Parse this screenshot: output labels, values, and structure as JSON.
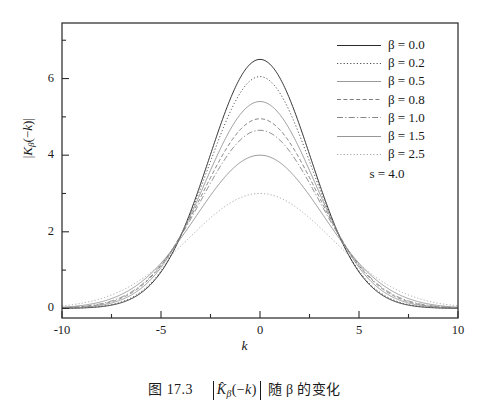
{
  "caption": {
    "figure_number": "图 17.3",
    "formula_inner": "K̂β(−k)",
    "suffix": "随 β 的变化",
    "full_text": "图 17.3  |K̂β(−k)| 随 β 的变化"
  },
  "legend": {
    "note": "s = 4.0",
    "entries": [
      {
        "label": "β = 0.0",
        "style": "solid",
        "color": "#2b2b2b"
      },
      {
        "label": "β = 0.2",
        "style": "dotted",
        "color": "#3a3a3a"
      },
      {
        "label": "β = 0.5",
        "style": "solid",
        "color": "#8e8e8e"
      },
      {
        "label": "β = 0.8",
        "style": "dashed",
        "color": "#6e6e6e"
      },
      {
        "label": "β = 1.0",
        "style": "dashdot",
        "color": "#7a7a7a"
      },
      {
        "label": "β = 1.5",
        "style": "solid",
        "color": "#8a8a8a"
      },
      {
        "label": "β = 2.5",
        "style": "dotted",
        "color": "#9a9a9a"
      }
    ]
  },
  "axes": {
    "x_title": "k",
    "y_title": "|Kβ(−k)|",
    "x_ticks": [
      "-10",
      "-5",
      "0",
      "5",
      "10"
    ],
    "y_ticks": [
      "0",
      "2",
      "4",
      "6"
    ]
  },
  "chart_data": {
    "type": "line",
    "title": "",
    "xlabel": "k",
    "ylabel": "|K_beta(-k)|",
    "xlim": [
      -10,
      10
    ],
    "ylim": [
      -0.25,
      7.45
    ],
    "xticks": [
      -10,
      -5,
      0,
      5,
      10
    ],
    "yticks": [
      0,
      2,
      4,
      6
    ],
    "xminor": [
      -7.5,
      -2.5,
      2.5,
      7.5
    ],
    "yminor": [
      1,
      3,
      5,
      7
    ],
    "grid": false,
    "legend_position": "upper right",
    "annotations": [
      "s = 4.0"
    ],
    "x": [
      -10,
      -9.5,
      -9,
      -8.5,
      -8,
      -7.5,
      -7,
      -6.5,
      -6,
      -5.5,
      -5,
      -4.5,
      -4,
      -3.5,
      -3,
      -2.5,
      -2,
      -1.5,
      -1,
      -0.5,
      0,
      0.5,
      1,
      1.5,
      2,
      2.5,
      3,
      3.5,
      4,
      4.5,
      5,
      5.5,
      6,
      6.5,
      7,
      7.5,
      8,
      8.5,
      9,
      9.5,
      10
    ],
    "series": [
      {
        "name": "β = 0.0",
        "peak": 6.5,
        "width": 2.55,
        "style": "solid",
        "color": "#2b2b2b",
        "values": [
          0.01,
          0.02,
          0.03,
          0.05,
          0.08,
          0.13,
          0.2,
          0.31,
          0.46,
          0.68,
          0.97,
          1.34,
          1.81,
          2.37,
          3.0,
          3.68,
          4.37,
          5.03,
          5.6,
          6.08,
          6.5,
          6.08,
          5.6,
          5.03,
          4.37,
          3.68,
          3.0,
          2.37,
          1.81,
          1.34,
          0.97,
          0.68,
          0.46,
          0.31,
          0.2,
          0.13,
          0.08,
          0.05,
          0.03,
          0.02,
          0.01
        ]
      },
      {
        "name": "β = 0.2",
        "peak": 6.05,
        "width": 2.62,
        "style": "dotted",
        "color": "#3a3a3a",
        "values": [
          0.01,
          0.02,
          0.03,
          0.05,
          0.09,
          0.14,
          0.22,
          0.33,
          0.48,
          0.69,
          0.97,
          1.32,
          1.75,
          2.26,
          2.84,
          3.45,
          4.07,
          4.67,
          5.2,
          5.68,
          6.05,
          5.68,
          5.2,
          4.67,
          4.07,
          3.45,
          2.84,
          2.26,
          1.75,
          1.32,
          0.97,
          0.69,
          0.48,
          0.33,
          0.22,
          0.14,
          0.09,
          0.05,
          0.03,
          0.02,
          0.01
        ]
      },
      {
        "name": "β = 0.5",
        "peak": 5.4,
        "width": 2.78,
        "style": "solid",
        "color": "#8e8e8e",
        "values": [
          0.01,
          0.02,
          0.04,
          0.06,
          0.1,
          0.16,
          0.24,
          0.35,
          0.51,
          0.71,
          0.97,
          1.3,
          1.69,
          2.15,
          2.66,
          3.2,
          3.74,
          4.27,
          4.74,
          5.14,
          5.4,
          5.14,
          4.74,
          4.27,
          3.74,
          3.2,
          2.66,
          2.15,
          1.69,
          1.3,
          0.97,
          0.71,
          0.51,
          0.35,
          0.24,
          0.16,
          0.1,
          0.06,
          0.04,
          0.02,
          0.01
        ]
      },
      {
        "name": "β = 0.8",
        "peak": 4.95,
        "width": 2.9,
        "style": "dashed",
        "color": "#6e6e6e",
        "values": [
          0.02,
          0.03,
          0.05,
          0.07,
          0.11,
          0.17,
          0.26,
          0.38,
          0.53,
          0.73,
          0.98,
          1.28,
          1.64,
          2.05,
          2.5,
          2.97,
          3.45,
          3.9,
          4.31,
          4.68,
          4.95,
          4.68,
          4.31,
          3.9,
          3.45,
          2.97,
          2.5,
          2.05,
          1.64,
          1.28,
          0.98,
          0.73,
          0.53,
          0.38,
          0.26,
          0.17,
          0.11,
          0.07,
          0.05,
          0.03,
          0.02
        ]
      },
      {
        "name": "β = 1.0",
        "peak": 4.65,
        "width": 2.98,
        "style": "dashdot",
        "color": "#7a7a7a",
        "values": [
          0.02,
          0.03,
          0.05,
          0.08,
          0.12,
          0.18,
          0.27,
          0.39,
          0.55,
          0.75,
          0.99,
          1.28,
          1.62,
          2.0,
          2.41,
          2.84,
          3.28,
          3.69,
          4.07,
          4.42,
          4.65,
          4.42,
          4.07,
          3.69,
          3.28,
          2.84,
          2.41,
          2.0,
          1.62,
          1.28,
          0.99,
          0.75,
          0.55,
          0.39,
          0.27,
          0.18,
          0.12,
          0.08,
          0.05,
          0.03,
          0.02
        ]
      },
      {
        "name": "β = 1.5",
        "peak": 4.0,
        "width": 3.2,
        "style": "solid",
        "color": "#8a8a8a",
        "values": [
          0.03,
          0.04,
          0.07,
          0.1,
          0.15,
          0.22,
          0.31,
          0.44,
          0.6,
          0.79,
          1.02,
          1.28,
          1.57,
          1.89,
          2.22,
          2.56,
          2.9,
          3.22,
          3.5,
          3.76,
          4.0,
          3.76,
          3.5,
          3.22,
          2.9,
          2.56,
          2.22,
          1.89,
          1.57,
          1.28,
          1.02,
          0.79,
          0.6,
          0.44,
          0.31,
          0.22,
          0.15,
          0.1,
          0.07,
          0.04,
          0.03
        ]
      },
      {
        "name": "β = 2.5",
        "peak": 3.0,
        "width": 3.62,
        "style": "dotted",
        "color": "#9a9a9a",
        "values": [
          0.05,
          0.07,
          0.11,
          0.15,
          0.21,
          0.29,
          0.39,
          0.52,
          0.67,
          0.84,
          1.03,
          1.24,
          1.46,
          1.69,
          1.92,
          2.14,
          2.36,
          2.56,
          2.73,
          2.88,
          3.0,
          2.88,
          2.73,
          2.56,
          2.36,
          2.14,
          1.92,
          1.69,
          1.46,
          1.24,
          1.03,
          0.84,
          0.67,
          0.52,
          0.39,
          0.29,
          0.21,
          0.15,
          0.11,
          0.07,
          0.05
        ]
      }
    ]
  }
}
